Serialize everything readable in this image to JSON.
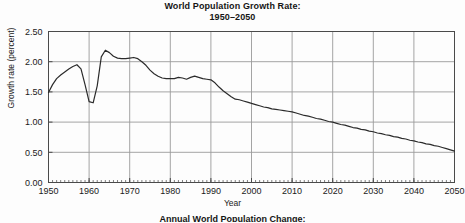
{
  "title": {
    "line1": "World Population Growth Rate:",
    "line2": "1950–2050"
  },
  "footer_caption": "Annual World Population Change:",
  "axis": {
    "x_title": "Year",
    "y_title": "Growth rate (percent)"
  },
  "colors": {
    "line": "#2b2b2b",
    "grid": "#9a9a9a",
    "frame": "#4a4a4a",
    "background": "#fdfdfd",
    "text": "#1a1a1a"
  },
  "chart_data": {
    "type": "line",
    "title": "World Population Growth Rate: 1950–2050",
    "xlabel": "Year",
    "ylabel": "Growth rate (percent)",
    "xlim": [
      1950,
      2050
    ],
    "ylim": [
      0.0,
      2.5
    ],
    "grid": true,
    "legend": "none",
    "xticks": [
      1950,
      1960,
      1970,
      1980,
      1990,
      2000,
      2010,
      2020,
      2030,
      2040,
      2050
    ],
    "xticklabels": [
      "1950",
      "1960",
      "1970",
      "1980",
      "1990",
      "2000",
      "2010",
      "2020",
      "2030",
      "2040",
      "2050"
    ],
    "yticks": [
      0.0,
      0.5,
      1.0,
      1.5,
      2.0,
      2.5
    ],
    "yticklabels": [
      "0.00",
      "0.50",
      "1.00",
      "1.50",
      "2.00",
      "2.50"
    ],
    "x_minor_tick_interval": 1,
    "series": [
      {
        "name": "World population growth rate",
        "x": [
          1950,
          1951,
          1952,
          1953,
          1954,
          1955,
          1956,
          1957,
          1958,
          1959,
          1960,
          1961,
          1962,
          1963,
          1964,
          1965,
          1966,
          1967,
          1968,
          1969,
          1970,
          1971,
          1972,
          1973,
          1974,
          1975,
          1976,
          1977,
          1978,
          1979,
          1980,
          1981,
          1982,
          1983,
          1984,
          1985,
          1986,
          1987,
          1988,
          1989,
          1990,
          1991,
          1992,
          1993,
          1994,
          1995,
          1996,
          1997,
          1998,
          1999,
          2000,
          2001,
          2002,
          2003,
          2004,
          2005,
          2006,
          2007,
          2008,
          2009,
          2010,
          2011,
          2012,
          2013,
          2014,
          2015,
          2016,
          2017,
          2018,
          2019,
          2020,
          2021,
          2022,
          2023,
          2024,
          2025,
          2026,
          2027,
          2028,
          2029,
          2030,
          2031,
          2032,
          2033,
          2034,
          2035,
          2036,
          2037,
          2038,
          2039,
          2040,
          2041,
          2042,
          2043,
          2044,
          2045,
          2046,
          2047,
          2048,
          2049,
          2050
        ],
        "values": [
          1.49,
          1.62,
          1.72,
          1.78,
          1.83,
          1.88,
          1.92,
          1.95,
          1.88,
          1.62,
          1.34,
          1.32,
          1.6,
          2.08,
          2.19,
          2.15,
          2.09,
          2.06,
          2.05,
          2.05,
          2.06,
          2.07,
          2.05,
          2.0,
          1.94,
          1.86,
          1.8,
          1.76,
          1.73,
          1.72,
          1.72,
          1.72,
          1.74,
          1.73,
          1.71,
          1.74,
          1.76,
          1.74,
          1.72,
          1.71,
          1.7,
          1.65,
          1.58,
          1.52,
          1.47,
          1.42,
          1.38,
          1.37,
          1.35,
          1.33,
          1.31,
          1.29,
          1.27,
          1.25,
          1.24,
          1.22,
          1.21,
          1.2,
          1.19,
          1.18,
          1.17,
          1.15,
          1.13,
          1.11,
          1.1,
          1.08,
          1.06,
          1.05,
          1.03,
          1.01,
          1.0,
          0.98,
          0.96,
          0.95,
          0.93,
          0.91,
          0.9,
          0.88,
          0.87,
          0.85,
          0.84,
          0.82,
          0.81,
          0.79,
          0.78,
          0.76,
          0.75,
          0.73,
          0.72,
          0.7,
          0.69,
          0.67,
          0.66,
          0.64,
          0.63,
          0.61,
          0.6,
          0.58,
          0.56,
          0.54,
          0.52
        ]
      }
    ]
  }
}
